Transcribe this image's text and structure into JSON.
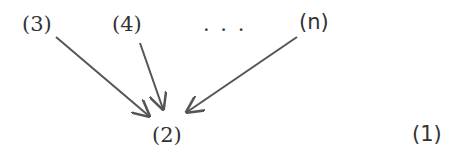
{
  "nodes": {
    "n3": "(3)",
    "n4": "(4)",
    "ellipsis": ". . .",
    "nn": "(n)",
    "n2": "(2)",
    "n1": "(1)"
  },
  "edges": [
    {
      "from": "(3)",
      "to": "(2)"
    },
    {
      "from": "(4)",
      "to": "(2)"
    },
    {
      "from": "(n)",
      "to": "(2)"
    }
  ],
  "colors": {
    "stroke": "#555555",
    "text": "#333333"
  }
}
